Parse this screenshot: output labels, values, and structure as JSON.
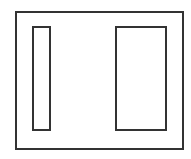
{
  "diagram": {
    "stroke_color": "#333333",
    "background_color": "#ffffff",
    "shapes": [
      {
        "id": "outer-frame",
        "type": "rect",
        "x": 15,
        "y": 11,
        "width": 169,
        "height": 139
      },
      {
        "id": "left-panel",
        "type": "rect",
        "x": 32,
        "y": 26,
        "width": 19,
        "height": 105
      },
      {
        "id": "right-panel",
        "type": "rect",
        "x": 115,
        "y": 26,
        "width": 52,
        "height": 105
      }
    ]
  }
}
